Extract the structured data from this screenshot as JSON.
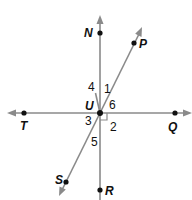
{
  "colors": {
    "line": "#8a8a8a",
    "point": "#111111",
    "background": "#ffffff"
  },
  "points": {
    "N": {
      "label": "N"
    },
    "P": {
      "label": "P"
    },
    "T": {
      "label": "T"
    },
    "Q": {
      "label": "Q"
    },
    "S": {
      "label": "S"
    },
    "R": {
      "label": "R"
    },
    "U": {
      "label": "U"
    }
  },
  "angles": {
    "a1": "1",
    "a2": "2",
    "a3": "3",
    "a4": "4",
    "a5": "5",
    "a6": "6"
  },
  "lines": [
    {
      "name": "line-NR",
      "from": "N",
      "to": "R"
    },
    {
      "name": "line-TQ",
      "from": "T",
      "to": "Q"
    },
    {
      "name": "line-SP",
      "from": "S",
      "to": "P"
    }
  ],
  "right_angle_marker": {
    "at": "U",
    "between": [
      "UQ",
      "UR"
    ]
  }
}
